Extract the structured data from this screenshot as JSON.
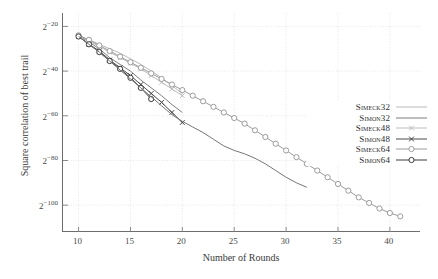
{
  "chart_data": {
    "type": "line",
    "title": "",
    "xlabel": "Number of Rounds",
    "ylabel": "Square correlation of best trail",
    "xlim": [
      8.5,
      43
    ],
    "ylim": [
      -112,
      -14
    ],
    "xticks": [
      10,
      15,
      20,
      25,
      30,
      35,
      40
    ],
    "yticks": [
      -20,
      -40,
      -60,
      -80,
      -100
    ],
    "ytick_labels": [
      "2−20",
      "2−40",
      "2−60",
      "2−80",
      "2−100"
    ],
    "grid": true,
    "legend_position": "right-middle",
    "series": [
      {
        "name": "Simeck32",
        "color": "#b9b9b9",
        "marker": "none",
        "x": [
          10,
          11,
          12,
          13,
          14,
          15,
          16,
          17,
          18,
          19,
          20
        ],
        "y": [
          -24.0,
          -26.0,
          -28.0,
          -30.0,
          -32.0,
          -34.5,
          -37.0,
          -40.0,
          -43.0,
          -46.5,
          -50.0
        ]
      },
      {
        "name": "Simon32",
        "color": "#7d7d7d",
        "marker": "none",
        "x": [
          10,
          11,
          12,
          13,
          14,
          15,
          16,
          17,
          18,
          19,
          20
        ],
        "y": [
          -24.0,
          -27.0,
          -30.0,
          -34.0,
          -37.0,
          -40.0,
          -44.0,
          -47.5,
          -51.0,
          -55.0,
          -58.5
        ]
      },
      {
        "name": "Simeck48",
        "color": "#bdbdbd",
        "marker": "x",
        "x": [
          10,
          11,
          12,
          13,
          14,
          15,
          16,
          17,
          18,
          19,
          20
        ],
        "y": [
          -24.0,
          -26.5,
          -29.0,
          -31.5,
          -34.0,
          -36.5,
          -39.0,
          -42.0,
          -45.0,
          -48.0,
          -51.0
        ]
      },
      {
        "name": "Simon48",
        "color": "#484848",
        "marker": "x",
        "x": [
          10,
          11,
          12,
          13,
          14,
          15,
          16,
          17,
          18,
          19,
          20
        ],
        "y": [
          -24.5,
          -28.0,
          -31.0,
          -35.0,
          -38.5,
          -42.0,
          -46.0,
          -50.0,
          -54.0,
          -58.5,
          -63.0
        ]
      },
      {
        "name": "Simeck64",
        "color": "#9c9c9c",
        "marker": "o",
        "x": [
          10,
          11,
          12,
          13,
          14,
          15,
          16,
          17,
          18,
          19,
          20,
          21,
          22,
          23,
          24,
          25,
          26,
          27,
          28,
          29,
          30,
          31,
          32,
          33,
          34,
          35,
          36,
          37,
          38,
          39,
          40,
          41
        ],
        "y": [
          -24.0,
          -26.0,
          -28.5,
          -31.0,
          -33.5,
          -36.0,
          -38.5,
          -41.0,
          -43.5,
          -46.0,
          -48.5,
          -51.0,
          -53.5,
          -56.0,
          -58.5,
          -61.0,
          -63.5,
          -66.5,
          -69.5,
          -72.5,
          -75.5,
          -78.5,
          -81.5,
          -84.5,
          -87.5,
          -90.5,
          -93.5,
          -96.5,
          -99.0,
          -101.5,
          -103.5,
          -105.0
        ]
      },
      {
        "name": "Simon64",
        "color": "#3a3a3a",
        "marker": "o",
        "x": [
          10,
          11,
          12,
          13,
          14,
          15,
          16,
          17
        ],
        "y": [
          -24.5,
          -28.0,
          -31.5,
          -35.5,
          -39.0,
          -43.0,
          -47.5,
          -52.5
        ]
      },
      {
        "name": "Simeck64-upper",
        "color": "#767676",
        "marker": "none",
        "x": [
          10,
          11,
          12,
          13,
          14,
          15,
          16,
          17,
          18,
          19,
          20,
          21,
          22,
          23,
          24,
          25,
          26,
          27,
          28,
          29,
          30,
          31,
          32
        ],
        "y": [
          -24.5,
          -28.0,
          -31.5,
          -35.5,
          -39.5,
          -43.5,
          -47.5,
          -51.5,
          -55.5,
          -59.5,
          -62.5,
          -65.0,
          -67.5,
          -70.5,
          -73.5,
          -75.5,
          -77.0,
          -79.0,
          -81.5,
          -84.5,
          -87.5,
          -90.0,
          -92.0
        ]
      }
    ],
    "legend": [
      {
        "label": "Simeck32",
        "color": "#b9b9b9",
        "marker": "none"
      },
      {
        "label": "Simon32",
        "color": "#7d7d7d",
        "marker": "none"
      },
      {
        "label": "Simeck48",
        "color": "#bdbdbd",
        "marker": "x"
      },
      {
        "label": "Simon48",
        "color": "#484848",
        "marker": "x"
      },
      {
        "label": "Simeck64",
        "color": "#9c9c9c",
        "marker": "o"
      },
      {
        "label": "Simon64",
        "color": "#3a3a3a",
        "marker": "o"
      }
    ]
  }
}
